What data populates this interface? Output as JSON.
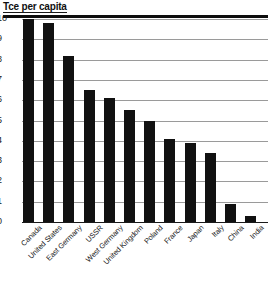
{
  "chart_data": {
    "type": "bar",
    "title": "Tce per capita",
    "xlabel": "",
    "ylabel": "Tce per capita",
    "ylim": [
      0,
      10
    ],
    "yticks": [
      0,
      1,
      2,
      3,
      4,
      5,
      6,
      7,
      8,
      9,
      10
    ],
    "grid": true,
    "legend": "none",
    "orientation": "vertical",
    "bar_color": "#111111",
    "categories": [
      "Canada",
      "United States",
      "East Germany",
      "USSR",
      "West Germany",
      "United Kingdom",
      "Poland",
      "France",
      "Japan",
      "Italy",
      "China",
      "India"
    ],
    "values": [
      10.0,
      9.8,
      8.2,
      6.5,
      6.1,
      5.5,
      5.0,
      4.1,
      3.9,
      3.4,
      0.9,
      0.3
    ]
  },
  "axis": {
    "y_tick_labels": [
      "10",
      "9",
      "8",
      "7",
      "6",
      "5",
      "4",
      "3",
      "2",
      "1",
      "0"
    ]
  }
}
